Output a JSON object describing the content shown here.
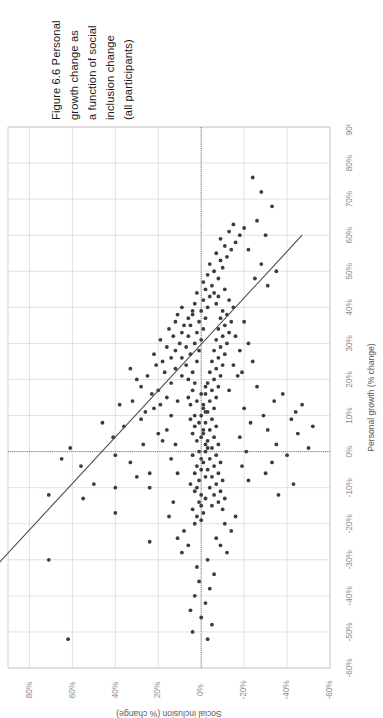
{
  "page": {
    "background": "#ffffff",
    "width": 383,
    "height": 718
  },
  "caption": {
    "label_prefix": "Figure 6.6",
    "lines": [
      "Figure 6.6  Personal",
      "growth change as",
      "a function of social",
      "inclusion change",
      "(all participants)"
    ],
    "full_text": "Figure 6.6  Personal growth change as a function of social inclusion change (all participants)",
    "rotation_deg": -90
  },
  "colors": {
    "point": "#3b3b44",
    "trend": "#4a4a4a",
    "grid": "#d6d6d6",
    "frame": "#c9c9c9",
    "zero_reference": "#6d6d6d",
    "tick_label": "#8a8a8a",
    "axis_title": "#59585c",
    "caption_text": "#1a1a1a"
  },
  "chart_data": {
    "type": "scatter",
    "title": "",
    "rotation_deg": -90,
    "orientation_note": "Chart is printed rotated 90 degrees counter-clockwise on the page.",
    "xlabel": "Personal growth (% change)",
    "ylabel": "Social inclusion (% change)",
    "xlim": [
      -60,
      90
    ],
    "ylim": [
      -60,
      90
    ],
    "xticks": [
      -60,
      -50,
      -40,
      -30,
      -20,
      -10,
      0,
      10,
      20,
      30,
      40,
      50,
      60,
      70,
      80,
      90
    ],
    "yticks": [
      -60,
      -40,
      -20,
      0,
      20,
      40,
      60,
      80
    ],
    "xticklabels": [
      "-60%",
      "-50%",
      "-40%",
      "-30%",
      "-20%",
      "-10%",
      "0%",
      "10%",
      "20%",
      "30%",
      "40%",
      "50%",
      "60%",
      "70%",
      "80%",
      "90%"
    ],
    "yticklabels": [
      "-60%",
      "-40%",
      "-20%",
      "0%",
      "20%",
      "40%",
      "60%",
      "80%"
    ],
    "grid": true,
    "legend": "none",
    "reference_lines": [
      {
        "axis": "x",
        "value": 0,
        "style": "dotted"
      },
      {
        "axis": "y",
        "value": 0,
        "style": "dotted"
      }
    ],
    "trendline": {
      "type": "linear",
      "x_start": -32,
      "y_start": 96,
      "x_end": 60,
      "y_end": -47,
      "slope": -1.554,
      "intercept": 46.3,
      "relationship": "negative"
    },
    "n_points": 268,
    "points": [
      [
        -52,
        62
      ],
      [
        -30,
        71
      ],
      [
        -12,
        71
      ],
      [
        -2,
        65
      ],
      [
        -13,
        55
      ],
      [
        -9,
        50
      ],
      [
        1,
        61
      ],
      [
        -4,
        56
      ],
      [
        -17,
        40
      ],
      [
        -10,
        40
      ],
      [
        -1,
        40
      ],
      [
        8,
        46
      ],
      [
        4,
        41
      ],
      [
        7,
        36
      ],
      [
        -3,
        33
      ],
      [
        -7,
        30
      ],
      [
        13,
        38
      ],
      [
        14,
        32
      ],
      [
        18,
        28
      ],
      [
        9,
        28
      ],
      [
        2,
        27
      ],
      [
        -25,
        24
      ],
      [
        -10,
        24
      ],
      [
        -6,
        24
      ],
      [
        11,
        26
      ],
      [
        12,
        22
      ],
      [
        16,
        23
      ],
      [
        20,
        30
      ],
      [
        21,
        25
      ],
      [
        23,
        33
      ],
      [
        24,
        21
      ],
      [
        5,
        20
      ],
      [
        3,
        18
      ],
      [
        13,
        19
      ],
      [
        15,
        16
      ],
      [
        17,
        20
      ],
      [
        19,
        14
      ],
      [
        22,
        17
      ],
      [
        25,
        18
      ],
      [
        26,
        14
      ],
      [
        27,
        22
      ],
      [
        28,
        12
      ],
      [
        29,
        16
      ],
      [
        30,
        10
      ],
      [
        31,
        19
      ],
      [
        32,
        13
      ],
      [
        33,
        9
      ],
      [
        34,
        15
      ],
      [
        35,
        8
      ],
      [
        36,
        12
      ],
      [
        37,
        6
      ],
      [
        38,
        11
      ],
      [
        39,
        4
      ],
      [
        40,
        9
      ],
      [
        20,
        6
      ],
      [
        21,
        9
      ],
      [
        22,
        4
      ],
      [
        23,
        12
      ],
      [
        24,
        7
      ],
      [
        25,
        2
      ],
      [
        26,
        9
      ],
      [
        27,
        5
      ],
      [
        28,
        1
      ],
      [
        29,
        7
      ],
      [
        30,
        3
      ],
      [
        31,
        0
      ],
      [
        32,
        6
      ],
      [
        33,
        2
      ],
      [
        34,
        -1
      ],
      [
        35,
        5
      ],
      [
        36,
        1
      ],
      [
        37,
        -2
      ],
      [
        38,
        4
      ],
      [
        39,
        0
      ],
      [
        40,
        -3
      ],
      [
        41,
        3
      ],
      [
        42,
        -1
      ],
      [
        43,
        -4
      ],
      [
        44,
        2
      ],
      [
        45,
        -2
      ],
      [
        14,
        2
      ],
      [
        15,
        6
      ],
      [
        16,
        0
      ],
      [
        17,
        4
      ],
      [
        18,
        -2
      ],
      [
        19,
        3
      ],
      [
        12,
        -1
      ],
      [
        13,
        5
      ],
      [
        10,
        3
      ],
      [
        11,
        -2
      ],
      [
        8,
        1
      ],
      [
        9,
        5
      ],
      [
        6,
        -1
      ],
      [
        7,
        3
      ],
      [
        4,
        0
      ],
      [
        5,
        4
      ],
      [
        2,
        -2
      ],
      [
        3,
        2
      ],
      [
        0,
        1
      ],
      [
        1,
        -3
      ],
      [
        -2,
        0
      ],
      [
        -1,
        4
      ],
      [
        -4,
        2
      ],
      [
        -3,
        -1
      ],
      [
        -6,
        3
      ],
      [
        -5,
        0
      ],
      [
        -8,
        1
      ],
      [
        -7,
        -2
      ],
      [
        -10,
        2
      ],
      [
        -9,
        5
      ],
      [
        -12,
        0
      ],
      [
        -11,
        3
      ],
      [
        -14,
        1
      ],
      [
        -13,
        -2
      ],
      [
        -16,
        4
      ],
      [
        -15,
        0
      ],
      [
        -18,
        2
      ],
      [
        -17,
        -1
      ],
      [
        -20,
        3
      ],
      [
        -19,
        0
      ],
      [
        46,
        -5
      ],
      [
        47,
        -1
      ],
      [
        48,
        -8
      ],
      [
        49,
        -3
      ],
      [
        50,
        -6
      ],
      [
        51,
        -10
      ],
      [
        52,
        -4
      ],
      [
        53,
        -9
      ],
      [
        54,
        -12
      ],
      [
        55,
        -7
      ],
      [
        56,
        -14
      ],
      [
        57,
        -11
      ],
      [
        58,
        -16
      ],
      [
        59,
        -9
      ],
      [
        60,
        -18
      ],
      [
        61,
        -13
      ],
      [
        62,
        -20
      ],
      [
        63,
        -15
      ],
      [
        44,
        -6
      ],
      [
        45,
        -11
      ],
      [
        43,
        -8
      ],
      [
        42,
        -13
      ],
      [
        41,
        -7
      ],
      [
        40,
        -15
      ],
      [
        39,
        -10
      ],
      [
        38,
        -12
      ],
      [
        37,
        -9
      ],
      [
        36,
        -14
      ],
      [
        35,
        -11
      ],
      [
        34,
        -8
      ],
      [
        33,
        -13
      ],
      [
        32,
        -10
      ],
      [
        31,
        -7
      ],
      [
        30,
        -12
      ],
      [
        29,
        -9
      ],
      [
        28,
        -6
      ],
      [
        27,
        -11
      ],
      [
        26,
        -8
      ],
      [
        25,
        -5
      ],
      [
        24,
        -10
      ],
      [
        23,
        -7
      ],
      [
        22,
        -4
      ],
      [
        21,
        -9
      ],
      [
        20,
        -6
      ],
      [
        19,
        -3
      ],
      [
        18,
        -8
      ],
      [
        17,
        -5
      ],
      [
        16,
        -2
      ],
      [
        15,
        -7
      ],
      [
        14,
        -4
      ],
      [
        13,
        -1
      ],
      [
        12,
        -6
      ],
      [
        11,
        -3
      ],
      [
        10,
        0
      ],
      [
        9,
        -5
      ],
      [
        8,
        -2
      ],
      [
        7,
        -7
      ],
      [
        6,
        -4
      ],
      [
        5,
        -1
      ],
      [
        4,
        -6
      ],
      [
        3,
        -3
      ],
      [
        2,
        -8
      ],
      [
        1,
        -5
      ],
      [
        0,
        -2
      ],
      [
        -1,
        -7
      ],
      [
        -2,
        -4
      ],
      [
        -3,
        -9
      ],
      [
        -4,
        -6
      ],
      [
        -5,
        -3
      ],
      [
        -6,
        -8
      ],
      [
        -7,
        -5
      ],
      [
        -8,
        -10
      ],
      [
        -9,
        -7
      ],
      [
        -10,
        -4
      ],
      [
        -11,
        -9
      ],
      [
        -12,
        -6
      ],
      [
        -13,
        -11
      ],
      [
        -14,
        -8
      ],
      [
        -15,
        -5
      ],
      [
        -16,
        -10
      ],
      [
        30,
        -22
      ],
      [
        25,
        -24
      ],
      [
        -22,
        -14
      ],
      [
        -24,
        -7
      ],
      [
        -28,
        -12
      ],
      [
        -18,
        -16
      ],
      [
        -20,
        -11
      ],
      [
        -26,
        -9
      ],
      [
        12,
        -20
      ],
      [
        8,
        -23
      ],
      [
        4,
        -18
      ],
      [
        0,
        -21
      ],
      [
        -4,
        -19
      ],
      [
        -8,
        -22
      ],
      [
        18,
        -26
      ],
      [
        22,
        -19
      ],
      [
        2,
        -35
      ],
      [
        6,
        -31
      ],
      [
        -3,
        -33
      ],
      [
        10,
        -29
      ],
      [
        14,
        -34
      ],
      [
        -6,
        -30
      ],
      [
        16,
        -38
      ],
      [
        -1,
        -40
      ],
      [
        5,
        -45
      ],
      [
        9,
        -42
      ],
      [
        -12,
        -36
      ],
      [
        13,
        -47
      ],
      [
        -9,
        -43
      ],
      [
        1,
        -50
      ],
      [
        7,
        -52
      ],
      [
        11,
        -44
      ],
      [
        48,
        -25
      ],
      [
        52,
        -28
      ],
      [
        56,
        -22
      ],
      [
        60,
        -30
      ],
      [
        64,
        -26
      ],
      [
        68,
        -33
      ],
      [
        46,
        -31
      ],
      [
        50,
        -35
      ],
      [
        72,
        -28
      ],
      [
        76,
        -24
      ],
      [
        24,
        -15
      ],
      [
        28,
        -18
      ],
      [
        32,
        -16
      ],
      [
        36,
        -20
      ],
      [
        17,
        -13
      ],
      [
        21,
        -17
      ],
      [
        -30,
        -3
      ],
      [
        -32,
        2
      ],
      [
        -34,
        -6
      ],
      [
        -36,
        1
      ],
      [
        -38,
        -4
      ],
      [
        -40,
        3
      ],
      [
        -42,
        -2
      ],
      [
        -44,
        5
      ],
      [
        -46,
        0
      ],
      [
        -48,
        -5
      ],
      [
        -50,
        4
      ],
      [
        -52,
        -3
      ],
      [
        -22,
        8
      ],
      [
        -26,
        6
      ],
      [
        -24,
        11
      ],
      [
        -28,
        9
      ],
      [
        -2,
        14
      ],
      [
        2,
        12
      ],
      [
        6,
        16
      ],
      [
        -6,
        11
      ],
      [
        10,
        14
      ],
      [
        -14,
        13
      ],
      [
        14,
        11
      ],
      [
        -18,
        15
      ]
    ]
  }
}
